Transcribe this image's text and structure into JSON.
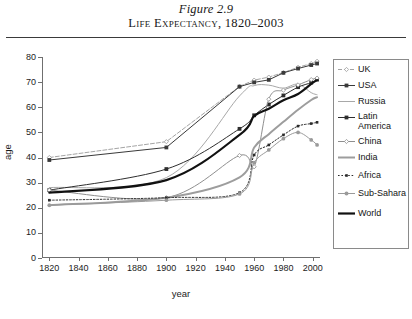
{
  "figure": {
    "number": "Figure 2.9",
    "caption": "Life Expectancy, 1820–2003"
  },
  "chart_data": {
    "type": "line",
    "title": "Life Expectancy, 1820–2003",
    "xlabel": "year",
    "ylabel": "age",
    "xlim": [
      1815,
      2005
    ],
    "ylim": [
      0,
      80
    ],
    "xticks": [
      1820,
      1840,
      1860,
      1880,
      1900,
      1920,
      1940,
      1960,
      1980,
      2000
    ],
    "yticks": [
      0,
      10,
      20,
      30,
      40,
      50,
      60,
      70,
      80
    ],
    "grid": false,
    "legend_position": "right",
    "series": [
      {
        "name": "UK",
        "color": "#9a9a9a",
        "style": "dashed",
        "marker": "diamond",
        "x": [
          1820,
          1900,
          1950,
          1960,
          1970,
          1980,
          1990,
          1999,
          2003
        ],
        "values": [
          40.0,
          46.3,
          68.3,
          70.8,
          72.0,
          73.8,
          75.9,
          77.4,
          78.3
        ]
      },
      {
        "name": "USA",
        "color": "#3a3a3a",
        "style": "solid",
        "marker": "square",
        "x": [
          1820,
          1900,
          1950,
          1960,
          1970,
          1980,
          1990,
          1999,
          2003
        ],
        "values": [
          39.0,
          44.0,
          68.2,
          69.9,
          70.9,
          73.7,
          75.4,
          76.8,
          77.4
        ]
      },
      {
        "name": "Russia",
        "color": "#a8a8a8",
        "style": "solid",
        "marker": "none",
        "x": [
          1820,
          1900,
          1950,
          1960,
          1970,
          1980,
          1990,
          1999,
          2003
        ],
        "values": [
          28.0,
          32.0,
          64.5,
          68.6,
          68.8,
          67.6,
          69.2,
          65.8,
          65.0
        ]
      },
      {
        "name": "Latin America",
        "color": "#2e2e2e",
        "style": "solid",
        "marker": "square",
        "x": [
          1820,
          1900,
          1950,
          1960,
          1970,
          1980,
          1990,
          1999,
          2003
        ],
        "values": [
          27.0,
          35.4,
          51.4,
          56.8,
          61.1,
          64.7,
          68.0,
          69.8,
          71.0
        ]
      },
      {
        "name": "China",
        "color": "#8f8f8f",
        "style": "solid",
        "marker": "diamond",
        "x": [
          1820,
          1900,
          1950,
          1960,
          1970,
          1980,
          1990,
          1999,
          2003
        ],
        "values": [
          27.0,
          24.0,
          40.8,
          36.3,
          63.2,
          66.8,
          68.9,
          71.0,
          71.6
        ]
      },
      {
        "name": "India",
        "color": "#9d9d9d",
        "style": "solid-thick",
        "marker": "none",
        "x": [
          1820,
          1900,
          1950,
          1960,
          1970,
          1980,
          1990,
          1999,
          2003
        ],
        "values": [
          21.0,
          24.0,
          32.1,
          44.0,
          49.3,
          54.2,
          59.0,
          62.9,
          64.0
        ]
      },
      {
        "name": "Africa",
        "color": "#2b2b2b",
        "style": "dotted",
        "marker": "small-square",
        "x": [
          1820,
          1900,
          1950,
          1960,
          1970,
          1980,
          1990,
          1999,
          2003
        ],
        "values": [
          23.0,
          24.0,
          26.0,
          41.0,
          45.0,
          49.0,
          52.5,
          53.5,
          54.0
        ]
      },
      {
        "name": "Sub-Sahara",
        "color": "#9a9a9a",
        "style": "solid",
        "marker": "circle",
        "x": [
          1820,
          1900,
          1950,
          1960,
          1970,
          1980,
          1990,
          1999,
          2003
        ],
        "values": [
          21.0,
          23.0,
          25.5,
          38.0,
          43.0,
          47.5,
          50.0,
          47.0,
          45.0
        ]
      },
      {
        "name": "World",
        "color": "#111111",
        "style": "solid-bold",
        "marker": "none",
        "x": [
          1820,
          1900,
          1950,
          1960,
          1970,
          1980,
          1990,
          1999,
          2003
        ],
        "values": [
          26.0,
          31.0,
          49.0,
          56.5,
          59.4,
          62.8,
          65.3,
          69.3,
          70.8
        ]
      }
    ]
  },
  "legend": {
    "items": [
      {
        "label": "UK"
      },
      {
        "label": "USA"
      },
      {
        "label": "Russia"
      },
      {
        "label": "Latin America"
      },
      {
        "label": "China"
      },
      {
        "label": "India"
      },
      {
        "label": "Africa"
      },
      {
        "label": "Sub-Sahara"
      },
      {
        "label": "World"
      }
    ]
  }
}
